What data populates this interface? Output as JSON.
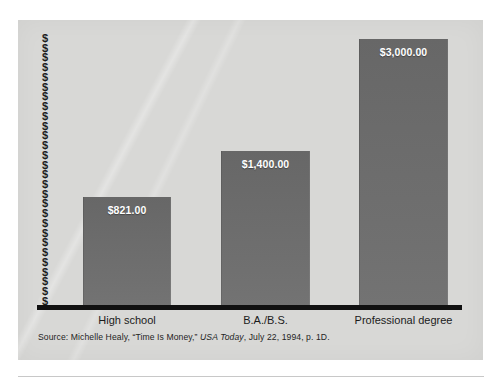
{
  "chart_data": {
    "type": "bar",
    "title": "",
    "subtitle": "",
    "xlabel": "",
    "ylabel": "$",
    "categories": [
      "High school",
      "B.A./B.S.",
      "Professional degree"
    ],
    "values": [
      821,
      1400,
      3000
    ],
    "value_labels": [
      "$821.00",
      "$1,400.00",
      "$3,000.00"
    ],
    "ylim": [
      0,
      3000
    ],
    "grid": false,
    "legend": null,
    "y_axis_tick_glyph": "$",
    "y_axis_tick_count": 28,
    "bar_color": "#6b6b6b",
    "panel_color": "#d8d8d6",
    "axis_color": "#111111",
    "value_label_color": "#ffffff",
    "annotations": [
      "Source: Michelle Healy, \"Time Is Money,\" USA Today, July 22, 1994, p. 1D."
    ]
  },
  "figure": {
    "source_note": {
      "prefix": "Source: Michelle Healy, “Time Is Money,” ",
      "italic": "USA Today",
      "suffix": ", July 22, 1994, p. 1D."
    }
  }
}
